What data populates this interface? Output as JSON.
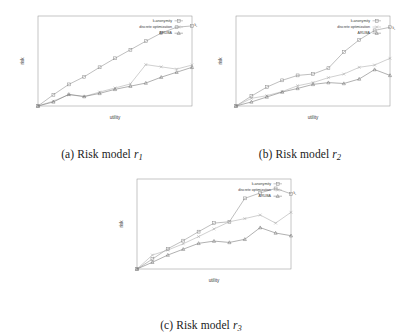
{
  "figure": {
    "axis_labels": {
      "x": "utility",
      "y": "risk"
    },
    "origin_label": "k=100",
    "end_label": "k_f",
    "legend": [
      {
        "key": "k-anonymity",
        "label": "k-anonymity",
        "marker": "square",
        "color": "#8a8a8a"
      },
      {
        "key": "discrete-optimization",
        "label": "discrete optimization",
        "marker": "cross",
        "color": "#a8a8a8"
      },
      {
        "key": "aruba",
        "label": "ARUBA",
        "marker": "triangle",
        "color": "#6f6f6f"
      }
    ],
    "captions": {
      "a": {
        "index": "(a)",
        "text": "Risk model",
        "symbol": "r",
        "sub": "1"
      },
      "b": {
        "index": "(b)",
        "text": "Risk model",
        "symbol": "r",
        "sub": "2"
      },
      "c": {
        "index": "(c)",
        "text": "Risk model",
        "symbol": "r",
        "sub": "3"
      }
    }
  },
  "chart_data": [
    {
      "id": "a",
      "type": "line",
      "title": "(a) Risk model r1",
      "xlabel": "utility",
      "ylabel": "risk",
      "xlim": [
        0,
        10
      ],
      "ylim": [
        0,
        10
      ],
      "grid": false,
      "legend_position": "top-right",
      "annotations": [
        {
          "text": "k=100",
          "x": 0.2,
          "y": 0.2,
          "rotation": -40
        },
        {
          "text": "k_f",
          "x": 10.1,
          "y": 8.9,
          "rotation": 0
        }
      ],
      "x": [
        0,
        1,
        2,
        3,
        4,
        5,
        6,
        7,
        8,
        9,
        10
      ],
      "series": [
        {
          "name": "k-anonymity",
          "marker": "square",
          "values": [
            0.0,
            1.25,
            2.4,
            3.25,
            4.3,
            5.3,
            6.25,
            7.2,
            8.1,
            8.75,
            8.9
          ]
        },
        {
          "name": "discrete optimization",
          "marker": "cross",
          "values": [
            0.0,
            0.55,
            1.25,
            1.05,
            1.55,
            2.0,
            2.45,
            4.6,
            4.35,
            4.1,
            4.55
          ]
        },
        {
          "name": "ARUBA",
          "marker": "triangle",
          "values": [
            0.0,
            0.45,
            1.3,
            1.05,
            1.4,
            1.85,
            2.2,
            2.55,
            3.2,
            3.75,
            4.3
          ]
        }
      ]
    },
    {
      "id": "b",
      "type": "line",
      "title": "(b) Risk model r2",
      "xlabel": "utility",
      "ylabel": "risk",
      "xlim": [
        0,
        10
      ],
      "ylim": [
        0,
        10
      ],
      "grid": false,
      "legend_position": "top-right",
      "annotations": [
        {
          "text": "k=100",
          "x": 0.2,
          "y": 0.2,
          "rotation": -40
        },
        {
          "text": "k_f",
          "x": 10.1,
          "y": 8.6,
          "rotation": 0
        }
      ],
      "x": [
        0,
        1,
        2,
        3,
        4,
        5,
        6,
        7,
        8,
        9,
        10
      ],
      "series": [
        {
          "name": "k-anonymity",
          "marker": "square",
          "values": [
            0.0,
            1.1,
            2.1,
            2.85,
            3.4,
            3.55,
            4.2,
            6.0,
            7.35,
            8.4,
            8.75
          ]
        },
        {
          "name": "discrete optimization",
          "marker": "cross",
          "values": [
            0.0,
            0.85,
            1.15,
            1.6,
            2.25,
            2.6,
            3.15,
            3.55,
            4.3,
            4.55,
            5.3
          ]
        },
        {
          "name": "ARUBA",
          "marker": "triangle",
          "values": [
            0.0,
            0.45,
            1.0,
            1.55,
            1.95,
            2.4,
            2.6,
            2.5,
            3.0,
            4.05,
            3.4
          ]
        }
      ]
    },
    {
      "id": "c",
      "type": "line",
      "title": "(c) Risk model r3",
      "xlabel": "utility",
      "ylabel": "risk",
      "xlim": [
        0,
        10
      ],
      "ylim": [
        0,
        10
      ],
      "grid": false,
      "legend_position": "top-right",
      "annotations": [
        {
          "text": "k=100",
          "x": 0.2,
          "y": 0.2,
          "rotation": -40
        },
        {
          "text": "k_f",
          "x": 10.1,
          "y": 8.3,
          "rotation": 0
        }
      ],
      "x": [
        0,
        1,
        2,
        3,
        4,
        5,
        6,
        7,
        8,
        9,
        10
      ],
      "series": [
        {
          "name": "k-anonymity",
          "marker": "square",
          "values": [
            0.0,
            1.1,
            2.25,
            3.15,
            4.15,
            5.1,
            5.25,
            7.85,
            8.45,
            8.95,
            8.35
          ]
        },
        {
          "name": "discrete optimization",
          "marker": "cross",
          "values": [
            0.0,
            1.55,
            2.1,
            2.8,
            3.6,
            4.45,
            5.25,
            5.6,
            6.0,
            5.1,
            6.3
          ]
        },
        {
          "name": "ARUBA",
          "marker": "triangle",
          "values": [
            0.0,
            0.75,
            1.55,
            2.2,
            2.85,
            3.1,
            2.95,
            3.3,
            4.6,
            4.0,
            3.7
          ]
        }
      ]
    }
  ]
}
